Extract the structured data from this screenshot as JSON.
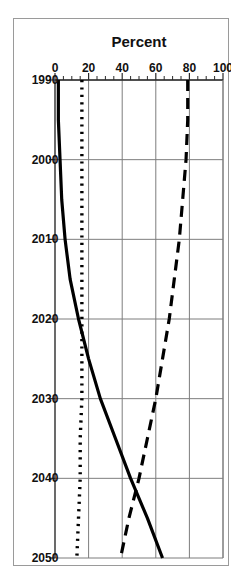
{
  "figure": {
    "name": "percent-line-chart",
    "background": "#ffffff",
    "frame_color": "#9a9a9a",
    "rotation_note": "chart rendered rotated 90 degrees clockwise as in source scan"
  },
  "chart_data": {
    "type": "line",
    "title": "",
    "subtitle": "",
    "xlabel": "",
    "ylabel": "Percent",
    "xlim": [
      1990,
      2050
    ],
    "ylim": [
      0,
      100
    ],
    "grid": true,
    "legend_position": "none",
    "xticks": [
      1990,
      2000,
      2010,
      2020,
      2030,
      2040,
      2050
    ],
    "xtick_labels": [
      "1990",
      "2000",
      "2010",
      "2020",
      "2030",
      "2040",
      "2050"
    ],
    "yticks": [
      0,
      20,
      40,
      60,
      80,
      100
    ],
    "ytick_labels": [
      "0",
      "20",
      "40",
      "60",
      "80",
      "100"
    ],
    "y_minor_tick_step": 5,
    "x": [
      1990,
      1995,
      2000,
      2005,
      2010,
      2015,
      2020,
      2025,
      2030,
      2035,
      2040,
      2045,
      2050
    ],
    "series": [
      {
        "name": "solid-series",
        "style": "solid",
        "color": "#000000",
        "values": [
          2,
          2,
          3,
          4,
          6,
          9,
          14,
          20,
          27,
          36,
          45,
          55,
          64
        ]
      },
      {
        "name": "dashed-series",
        "style": "dashed",
        "color": "#000000",
        "values": [
          79,
          79,
          78,
          76,
          74,
          71,
          68,
          64,
          60,
          55,
          50,
          44,
          39
        ]
      },
      {
        "name": "dotted-series",
        "style": "dotted",
        "color": "#000000",
        "values": [
          16,
          16,
          16,
          16,
          16,
          16,
          16,
          16,
          16,
          15,
          15,
          14,
          13
        ]
      }
    ],
    "annotations": [
      {
        "name": "crossover",
        "x": 2042,
        "y": 48,
        "text": ""
      }
    ]
  }
}
